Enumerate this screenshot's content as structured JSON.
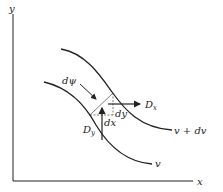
{
  "diagram": {
    "axes": {
      "x_label": "x",
      "y_label": "y"
    },
    "curves": [
      {
        "name": "v",
        "label": "v"
      },
      {
        "name": "v + dv",
        "label": "v + dv"
      }
    ],
    "labels": {
      "dpsi": "dψ",
      "dx": "dx",
      "dy": "dy",
      "Dx": "D",
      "Dx_sub": "x",
      "Dy": "D",
      "Dy_sub": "y"
    },
    "colors": {
      "ink": "#222222",
      "background": "#ffffff"
    }
  }
}
